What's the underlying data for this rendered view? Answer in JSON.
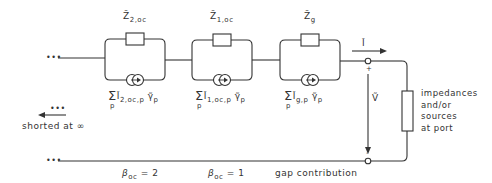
{
  "diagram": {
    "stages": [
      {
        "impedance_symbol": "Z̃",
        "impedance_sub": "2,oc",
        "sum_symbol": "Σ",
        "sum_index": "p",
        "source_symbol": "Ĩ",
        "source_sub": "2,oc,p",
        "weight_symbol": "γ̃",
        "weight_sub": "p"
      },
      {
        "impedance_symbol": "Z̃",
        "impedance_sub": "1,oc",
        "sum_symbol": "Σ",
        "sum_index": "p",
        "source_symbol": "Ĩ",
        "source_sub": "1,oc,p",
        "weight_symbol": "γ̃",
        "weight_sub": "p"
      },
      {
        "impedance_symbol": "Z̃",
        "impedance_sub": "g",
        "sum_symbol": "Σ",
        "sum_index": "p",
        "source_symbol": "Ĩ",
        "source_sub": "g,p",
        "weight_symbol": "γ̃",
        "weight_sub": "p"
      }
    ],
    "current_label": "Ĩ",
    "voltage_label": "Ṽ",
    "plus_sign": "+",
    "minus_sign": "-",
    "port_label_lines": [
      "impedances",
      "and/or",
      "sources",
      "at port"
    ],
    "left_ellipsis": "•••",
    "shorted_label": "shorted at ∞",
    "beta_labels": [
      {
        "symbol": "β",
        "sub": "oc",
        "value": "= 2"
      },
      {
        "symbol": "β",
        "sub": "oc",
        "value": "= 1"
      }
    ],
    "gap_label": "gap contribution",
    "colors": {
      "line": "#333333",
      "background": "#ffffff"
    }
  }
}
